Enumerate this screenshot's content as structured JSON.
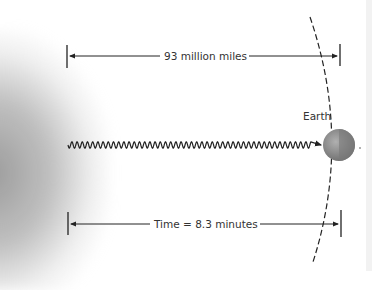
{
  "diagram": {
    "distance_label": "93 million miles",
    "time_label": "Time = 8.3 minutes",
    "planet_label": "Earth",
    "elements": [
      "sun-glow",
      "light-wave",
      "earth",
      "earth-orbit"
    ],
    "colors": {
      "line": "#222222",
      "earth": "#8a8a8a",
      "sun": "#a8a8a8"
    }
  }
}
